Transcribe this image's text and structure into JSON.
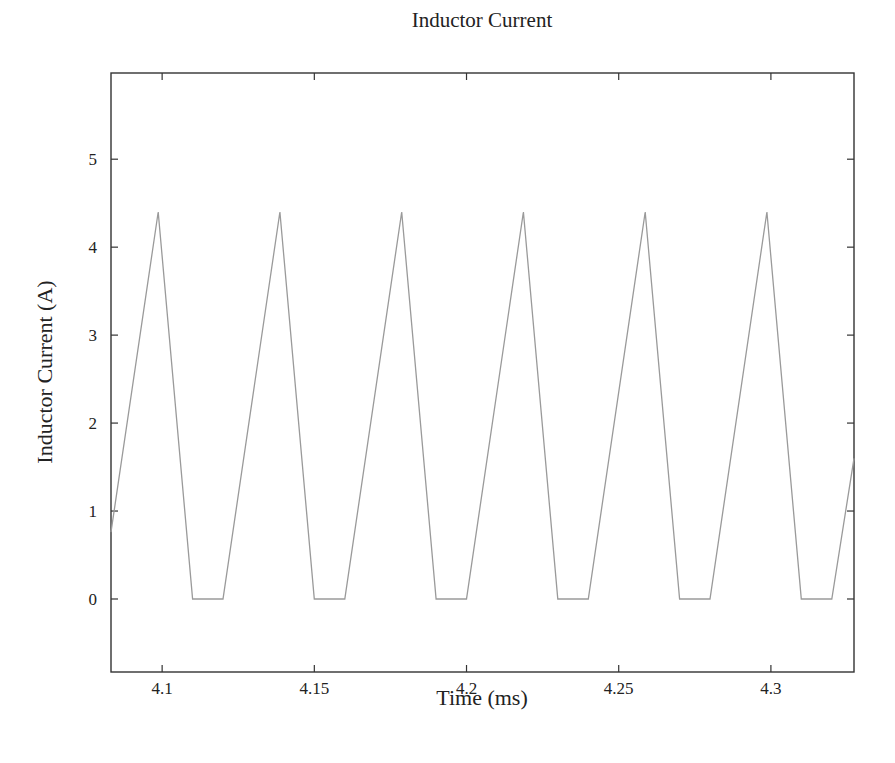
{
  "chart_data": {
    "type": "line",
    "title": "Inductor Current",
    "xlabel": "Time (ms)",
    "ylabel": "Inductor Current (A)",
    "xlim": [
      4.0832,
      4.3273
    ],
    "ylim": [
      -0.83,
      5.98
    ],
    "xticks": [
      4.1,
      4.15,
      4.2,
      4.25,
      4.3
    ],
    "xtick_labels": [
      "4.1",
      "4.15",
      "4.2",
      "4.25",
      "4.3"
    ],
    "yticks": [
      0,
      1,
      2,
      3,
      4,
      5
    ],
    "ytick_labels": [
      "0",
      "1",
      "2",
      "3",
      "4",
      "5"
    ],
    "grid": false,
    "legend": null,
    "series": [
      {
        "name": "Inductor Current",
        "color": "#9a9a9a",
        "x": [
          4.0832,
          4.0987,
          4.11,
          4.12,
          4.1387,
          4.15,
          4.16,
          4.1787,
          4.19,
          4.2,
          4.2187,
          4.23,
          4.24,
          4.2587,
          4.27,
          4.28,
          4.2987,
          4.31,
          4.32,
          4.3273
        ],
        "y": [
          0.76,
          4.4,
          0,
          0,
          4.4,
          0,
          0,
          4.4,
          0,
          0,
          4.4,
          0,
          0,
          4.4,
          0,
          0,
          4.4,
          0,
          0,
          1.6
        ]
      }
    ]
  },
  "style": {
    "frame_color": "#333333",
    "line_color": "#9a9a9a",
    "text_color": "#222222",
    "background": "#ffffff"
  }
}
